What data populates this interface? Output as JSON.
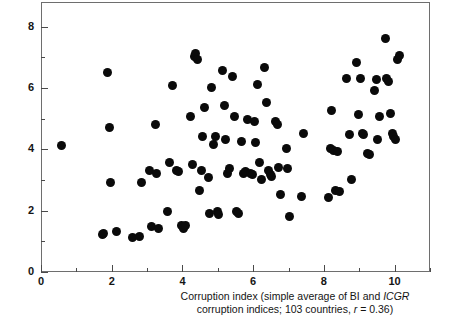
{
  "chart_data": {
    "type": "scatter",
    "title": "",
    "xlabel": "Corruption index (simple average of BI and ICGR corruption indices; 103 countries, r = 0.36)",
    "ylabel": "",
    "xlim": [
      0,
      11
    ],
    "ylim": [
      0,
      8.8
    ],
    "grid": false,
    "legend": null,
    "x_major_ticks": [
      0,
      2,
      4,
      6,
      8,
      10
    ],
    "x_minor_ticks": [
      1,
      3,
      5,
      7,
      9,
      11
    ],
    "y_major_ticks": [
      0,
      2,
      4,
      6,
      8
    ],
    "y_minor_ticks": [
      1,
      3,
      5,
      7
    ],
    "x_tick_labels": [
      "0",
      "2",
      "4",
      "6",
      "8",
      "10"
    ],
    "y_tick_labels": [
      "0",
      "2",
      "4",
      "6",
      "8"
    ],
    "marker": {
      "shape": "circle",
      "color": "#0a0a0a",
      "size_px": 9
    },
    "n_points": 103,
    "correlation_r": 0.36,
    "points": [
      [
        0.55,
        4.15
      ],
      [
        1.7,
        1.25
      ],
      [
        1.75,
        1.3
      ],
      [
        1.85,
        6.55
      ],
      [
        1.9,
        4.75
      ],
      [
        1.95,
        2.95
      ],
      [
        2.1,
        1.35
      ],
      [
        2.55,
        1.15
      ],
      [
        2.75,
        1.2
      ],
      [
        2.8,
        2.95
      ],
      [
        3.05,
        3.35
      ],
      [
        3.1,
        1.5
      ],
      [
        3.2,
        4.85
      ],
      [
        3.25,
        3.25
      ],
      [
        3.3,
        1.45
      ],
      [
        3.55,
        2.0
      ],
      [
        3.6,
        3.6
      ],
      [
        3.7,
        6.1
      ],
      [
        3.8,
        3.35
      ],
      [
        3.85,
        3.3
      ],
      [
        3.95,
        1.55
      ],
      [
        4.0,
        1.45
      ],
      [
        4.05,
        1.55
      ],
      [
        4.2,
        5.1
      ],
      [
        4.25,
        3.55
      ],
      [
        4.3,
        7.05
      ],
      [
        4.35,
        7.15
      ],
      [
        4.4,
        6.95
      ],
      [
        4.45,
        2.7
      ],
      [
        4.5,
        3.35
      ],
      [
        4.55,
        4.45
      ],
      [
        4.6,
        5.4
      ],
      [
        4.7,
        3.1
      ],
      [
        4.75,
        1.95
      ],
      [
        4.8,
        6.05
      ],
      [
        4.85,
        4.2
      ],
      [
        4.9,
        4.45
      ],
      [
        4.95,
        2.0
      ],
      [
        5.0,
        1.9
      ],
      [
        5.1,
        6.6
      ],
      [
        5.15,
        5.45
      ],
      [
        5.2,
        4.35
      ],
      [
        5.25,
        3.25
      ],
      [
        5.3,
        3.4
      ],
      [
        5.4,
        6.4
      ],
      [
        5.45,
        5.1
      ],
      [
        5.5,
        2.0
      ],
      [
        5.55,
        1.95
      ],
      [
        5.65,
        4.3
      ],
      [
        5.7,
        3.25
      ],
      [
        5.75,
        3.3
      ],
      [
        5.8,
        5.0
      ],
      [
        5.9,
        3.25
      ],
      [
        5.95,
        3.2
      ],
      [
        6.0,
        4.95
      ],
      [
        6.05,
        4.25
      ],
      [
        6.1,
        6.15
      ],
      [
        6.15,
        3.6
      ],
      [
        6.2,
        3.05
      ],
      [
        6.3,
        6.7
      ],
      [
        6.35,
        5.55
      ],
      [
        6.4,
        3.35
      ],
      [
        6.45,
        3.2
      ],
      [
        6.5,
        3.15
      ],
      [
        6.6,
        4.95
      ],
      [
        6.65,
        4.85
      ],
      [
        6.7,
        3.45
      ],
      [
        6.75,
        2.55
      ],
      [
        6.9,
        4.05
      ],
      [
        6.95,
        3.4
      ],
      [
        7.0,
        1.85
      ],
      [
        7.35,
        2.5
      ],
      [
        7.4,
        4.55
      ],
      [
        8.1,
        2.45
      ],
      [
        8.15,
        4.05
      ],
      [
        8.2,
        5.3
      ],
      [
        8.25,
        4.0
      ],
      [
        8.3,
        2.7
      ],
      [
        8.35,
        3.95
      ],
      [
        8.4,
        2.65
      ],
      [
        8.6,
        6.35
      ],
      [
        8.7,
        4.5
      ],
      [
        8.75,
        3.05
      ],
      [
        8.9,
        6.85
      ],
      [
        8.95,
        5.15
      ],
      [
        9.0,
        6.35
      ],
      [
        9.05,
        4.55
      ],
      [
        9.1,
        4.5
      ],
      [
        9.2,
        3.9
      ],
      [
        9.25,
        3.85
      ],
      [
        9.4,
        5.95
      ],
      [
        9.45,
        6.3
      ],
      [
        9.5,
        4.35
      ],
      [
        9.55,
        5.1
      ],
      [
        9.7,
        7.65
      ],
      [
        9.75,
        6.35
      ],
      [
        9.8,
        6.25
      ],
      [
        9.85,
        5.2
      ],
      [
        9.9,
        4.55
      ],
      [
        9.95,
        4.45
      ],
      [
        10.0,
        4.35
      ],
      [
        10.05,
        6.95
      ],
      [
        10.1,
        7.1
      ]
    ]
  },
  "caption": {
    "line1_pre": "Corruption index (simple average of BI and ",
    "line1_italic": "ICGR",
    "line2_pre": "corruption indices; 103 countries, ",
    "line2_italic": "r",
    "line2_post": " = 0.36)"
  }
}
